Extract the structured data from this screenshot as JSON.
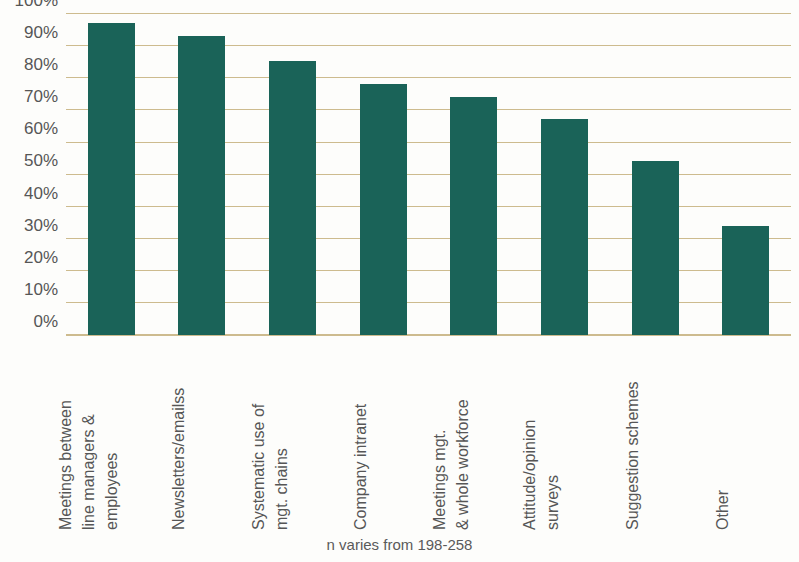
{
  "chart_data": {
    "type": "bar",
    "title": "",
    "subtitle": "",
    "xlabel": "",
    "ylabel": "",
    "ylim": [
      0,
      100
    ],
    "grid": true,
    "legend": "none",
    "bar_color": "#1a6358",
    "gridline_color": "#cdbb8e",
    "text_color": "#565656",
    "y_ticks": [
      "0%",
      "10%",
      "20%",
      "30%",
      "40%",
      "50%",
      "60%",
      "70%",
      "80%",
      "90%",
      "100%"
    ],
    "y_tick_values": [
      0,
      10,
      20,
      30,
      40,
      50,
      60,
      70,
      80,
      90,
      100
    ],
    "categories": [
      "Meetings between line managers & employees",
      "Newsletters/emailss",
      "Systematic use of mgt. chains",
      "Company intranet",
      "Meetings mgt. & whole workforce",
      "Attitude/opinion surveys",
      "Suggestion schemes",
      "Other"
    ],
    "category_lines": [
      [
        "Meetings between",
        "line managers &",
        "employees"
      ],
      [
        "Newsletters/emailss"
      ],
      [
        "Systematic use of",
        "mgt. chains"
      ],
      [
        "Company intranet"
      ],
      [
        "Meetings mgt.",
        "& whole workforce"
      ],
      [
        "Attitude/opinion",
        "surveys"
      ],
      [
        "Suggestion schemes"
      ],
      [
        "Other"
      ]
    ],
    "values": [
      97,
      93,
      85,
      78,
      74,
      67,
      54,
      34
    ],
    "annotation": "n varies from 198-258"
  }
}
